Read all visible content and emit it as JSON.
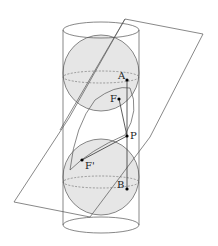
{
  "diagram": {
    "type": "dandelin-spheres",
    "points": {
      "A": "A",
      "F": "F",
      "P": "P",
      "F_prime": "F'",
      "B": "B"
    },
    "colors": {
      "sphere_fill": "#e6e6e6",
      "line": "#444444"
    }
  }
}
